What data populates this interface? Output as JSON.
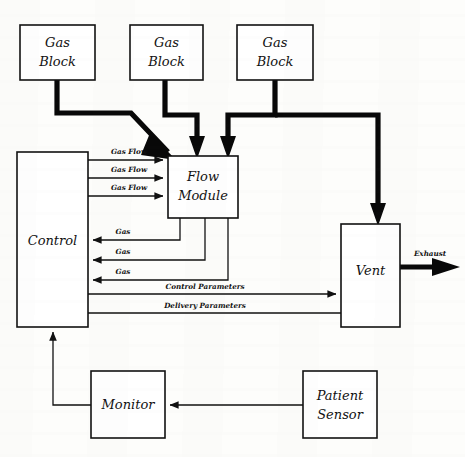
{
  "diagram": {
    "type": "block-diagram",
    "ink_color": "#111111",
    "background_color": "#fdfdfb",
    "nodes": [
      {
        "id": "gas_block_1",
        "label_line1": "Gas",
        "label_line2": "Block",
        "x": 20,
        "y": 25,
        "w": 75,
        "h": 55
      },
      {
        "id": "gas_block_2",
        "label_line1": "Gas",
        "label_line2": "Block",
        "x": 130,
        "y": 25,
        "w": 73,
        "h": 55
      },
      {
        "id": "gas_block_3",
        "label_line1": "Gas",
        "label_line2": "Block",
        "x": 237,
        "y": 25,
        "w": 76,
        "h": 55
      },
      {
        "id": "control",
        "label_line1": "Control",
        "label_line2": "",
        "x": 17,
        "y": 152,
        "w": 71,
        "h": 175
      },
      {
        "id": "flow_module",
        "label_line1": "Flow",
        "label_line2": "Module",
        "x": 168,
        "y": 156,
        "w": 70,
        "h": 62
      },
      {
        "id": "vent",
        "label_line1": "Vent",
        "label_line2": "",
        "x": 341,
        "y": 224,
        "w": 59,
        "h": 103
      },
      {
        "id": "monitor",
        "label_line1": "Monitor",
        "label_line2": "",
        "x": 91,
        "y": 371,
        "w": 74,
        "h": 67
      },
      {
        "id": "patient_sensor",
        "label_line1": "Patient",
        "label_line2": "Sensor",
        "x": 303,
        "y": 371,
        "w": 74,
        "h": 67
      }
    ],
    "edge_labels": [
      {
        "id": "gas_flow_1",
        "text": "Gas Flow",
        "x": 129,
        "y": 154
      },
      {
        "id": "gas_flow_2",
        "text": "Gas Flow",
        "x": 129,
        "y": 171
      },
      {
        "id": "gas_flow_3",
        "text": "Gas Flow",
        "x": 129,
        "y": 189
      },
      {
        "id": "gas_return_1",
        "text": "Gas",
        "x": 123,
        "y": 232
      },
      {
        "id": "gas_return_2",
        "text": "Gas",
        "x": 123,
        "y": 252
      },
      {
        "id": "gas_return_3",
        "text": "Gas",
        "x": 123,
        "y": 272
      },
      {
        "id": "control_parameters",
        "text": "Control Parameters",
        "x": 205,
        "y": 287
      },
      {
        "id": "delivery_parameters",
        "text": "Delivery Parameters",
        "x": 205,
        "y": 306
      },
      {
        "id": "exhaust",
        "text": "Exhaust",
        "x": 428,
        "y": 255
      }
    ],
    "connections": [
      {
        "id": "gasblock1-to-flowmodule",
        "from": "gas_block_1",
        "to": "flow_module",
        "style": "thick-pipe"
      },
      {
        "id": "gasblock2-to-flowmodule",
        "from": "gas_block_2",
        "to": "flow_module",
        "style": "thick-pipe"
      },
      {
        "id": "gasblock3-to-flowmodule",
        "from": "gas_block_3",
        "to": "flow_module",
        "style": "thick-pipe"
      },
      {
        "id": "gasblock3-to-vent",
        "from": "gas_block_3",
        "to": "vent",
        "style": "thick-pipe"
      },
      {
        "id": "control-to-flowmodule-1",
        "from": "control",
        "to": "flow_module",
        "style": "thin-line",
        "label": "Gas Flow"
      },
      {
        "id": "control-to-flowmodule-2",
        "from": "control",
        "to": "flow_module",
        "style": "thin-line",
        "label": "Gas Flow"
      },
      {
        "id": "control-to-flowmodule-3",
        "from": "control",
        "to": "flow_module",
        "style": "thin-line",
        "label": "Gas Flow"
      },
      {
        "id": "flowmodule-to-control-1",
        "from": "flow_module",
        "to": "control",
        "style": "thin-line",
        "label": "Gas"
      },
      {
        "id": "flowmodule-to-control-2",
        "from": "flow_module",
        "to": "control",
        "style": "thin-line",
        "label": "Gas"
      },
      {
        "id": "flowmodule-to-control-3",
        "from": "flow_module",
        "to": "control",
        "style": "thin-line",
        "label": "Gas"
      },
      {
        "id": "control-to-vent",
        "from": "control",
        "to": "vent",
        "style": "thin-line",
        "label": "Control Parameters"
      },
      {
        "id": "vent-to-control",
        "from": "vent",
        "to": "control",
        "style": "thin-line",
        "label": "Delivery Parameters"
      },
      {
        "id": "vent-to-exhaust",
        "from": "vent",
        "to": "exhaust",
        "style": "thick-arrow",
        "label": "Exhaust"
      },
      {
        "id": "patientsensor-to-monitor",
        "from": "patient_sensor",
        "to": "monitor",
        "style": "thin-line"
      },
      {
        "id": "monitor-to-control",
        "from": "monitor",
        "to": "control",
        "style": "thin-line"
      }
    ]
  }
}
